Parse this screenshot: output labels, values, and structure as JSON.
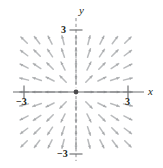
{
  "figure": {
    "title": "",
    "axis_labels": {
      "x": "x",
      "y": "y"
    },
    "tick_labels": {
      "x_positive": "3",
      "x_negative": "−3",
      "y_positive": "3",
      "y_negative": "−3"
    }
  },
  "colors": {
    "background": "#ffffff",
    "axis": "#6d6e71",
    "axis_dashed": "#8b8c8e",
    "arrow": "#b9bbbd",
    "arrow_head": "#a8aaac",
    "origin_dot": "#4a4a4c",
    "text": "#231f20"
  },
  "chart_data": {
    "type": "scatter",
    "subtype": "direction-field",
    "title": "",
    "xlabel": "x",
    "ylabel": "y",
    "xlim": [
      -3.6,
      3.6
    ],
    "ylim": [
      -3.6,
      3.6
    ],
    "xticks": [
      -3,
      3
    ],
    "yticks": [
      -3,
      3
    ],
    "xticklabels": [
      "−3",
      "3"
    ],
    "yticklabels": [
      "−3",
      "3"
    ],
    "grid": false,
    "legend": null,
    "field": {
      "description": "radial direction field; slope segments point directly away from the origin",
      "slope_formula": "dy/dx = y/x",
      "vector_formula": "(x, y)",
      "grid_spacing": 0.75,
      "grid_min": -3.0,
      "grid_max": 3.0,
      "segment_length_px": 9,
      "arrowheads": true,
      "origin_marker": true
    },
    "axes_style": {
      "x_axis": "solid",
      "y_axis": "dashed",
      "tick_direction": "crossing",
      "origin": [
        0,
        0
      ]
    }
  },
  "geometry": {
    "origin_px": {
      "x": 76,
      "y": 92
    },
    "scale_px_per_unit": 17.3,
    "width_px": 163,
    "height_px": 168
  }
}
